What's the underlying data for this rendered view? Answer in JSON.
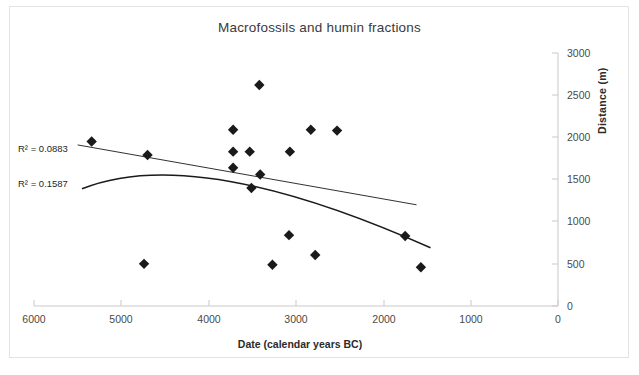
{
  "chart_data": {
    "type": "scatter",
    "title": "Macrofossils and humin fractions",
    "xlabel": "Date (calendar years BC)",
    "ylabel": "Distance (m)",
    "xlim": [
      6000,
      0
    ],
    "ylim": [
      0,
      3000
    ],
    "x_reversed": true,
    "grid": false,
    "legend": "none",
    "y_axis_position": "right",
    "xticks": [
      6000,
      5000,
      4000,
      3000,
      2000,
      1000,
      0
    ],
    "xtick_labels": [
      "6000",
      "5000",
      "4000",
      "3000",
      "2000",
      "1000",
      "0"
    ],
    "yticks": [
      0,
      500,
      1000,
      1500,
      2000,
      2500,
      3000
    ],
    "ytick_labels": [
      "0",
      "500",
      "1000",
      "1500",
      "2000",
      "2500",
      "3000"
    ],
    "marker": "filled-diamond",
    "marker_color": "#1a1a1a",
    "series": [
      {
        "name": "Macrofossils and humin fractions",
        "points": [
          {
            "x": 5340,
            "y": 1950
          },
          {
            "x": 4740,
            "y": 500
          },
          {
            "x": 4700,
            "y": 1790
          },
          {
            "x": 3720,
            "y": 2090
          },
          {
            "x": 3720,
            "y": 1830
          },
          {
            "x": 3720,
            "y": 1640
          },
          {
            "x": 3530,
            "y": 1830
          },
          {
            "x": 3510,
            "y": 1400
          },
          {
            "x": 3420,
            "y": 2620
          },
          {
            "x": 3410,
            "y": 1560
          },
          {
            "x": 3270,
            "y": 490
          },
          {
            "x": 3080,
            "y": 840
          },
          {
            "x": 3070,
            "y": 1830
          },
          {
            "x": 2830,
            "y": 2090
          },
          {
            "x": 2780,
            "y": 605
          },
          {
            "x": 2530,
            "y": 2080
          },
          {
            "x": 1750,
            "y": 830
          },
          {
            "x": 1570,
            "y": 460
          }
        ]
      }
    ],
    "annotations": [
      {
        "name": "r2-linear",
        "text_prefix": "R",
        "text_sup": "2",
        "text_suffix": " = 0.0883",
        "full": "R² = 0.0883"
      },
      {
        "name": "r2-polynomial",
        "text_prefix": "R",
        "text_sup": "2",
        "text_suffix": " = 0.1587",
        "full": "R² = 0.1587"
      }
    ],
    "trendlines": [
      {
        "name": "linear-trendline",
        "type": "linear",
        "r_squared": 0.0883,
        "x_start": 5500,
        "y_start": 1910,
        "x_end": 1620,
        "y_end": 1200
      },
      {
        "name": "polynomial-trendline",
        "type": "polynomial",
        "degree": 2,
        "r_squared": 0.1587,
        "x_start": 5450,
        "y_start": 1390,
        "x_vertex": 4150,
        "y_vertex": 1655,
        "x_end": 1460,
        "y_end": 690
      }
    ]
  },
  "axes": {
    "x_zero_left_label": "0"
  }
}
